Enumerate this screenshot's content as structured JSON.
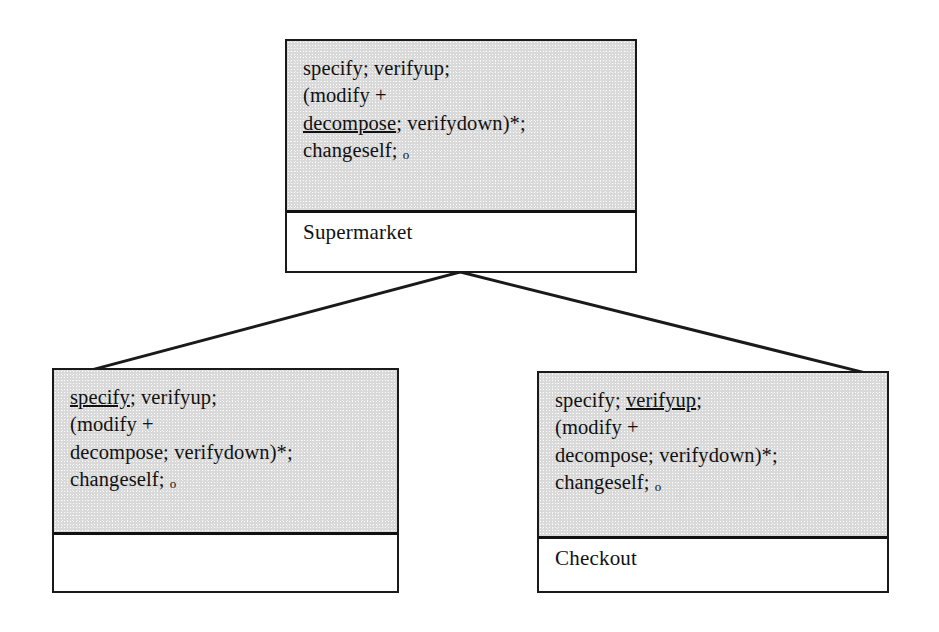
{
  "diagram": {
    "type": "class-hierarchy-tree",
    "background_color": "#ffffff",
    "node_body_color": "#d9d9d9",
    "line_color": "#1a1a1a"
  },
  "nodes": {
    "root": {
      "id": "root",
      "label": "Supermarket",
      "spec_lines": [
        {
          "segments": [
            {
              "text": "specify; verifyup;",
              "underline": false
            }
          ]
        },
        {
          "segments": [
            {
              "text": "(modify +",
              "underline": false
            }
          ]
        },
        {
          "segments": [
            {
              "text": "decompose",
              "underline": true
            },
            {
              "text": "; verifydown)*;",
              "underline": false
            }
          ]
        },
        {
          "segments": [
            {
              "text": "changeself; ",
              "underline": false
            },
            {
              "text": "o",
              "underline": false,
              "small": true
            }
          ]
        }
      ]
    },
    "left": {
      "id": "left",
      "label": "",
      "spec_lines": [
        {
          "segments": [
            {
              "text": "specify",
              "underline": true
            },
            {
              "text": "; verifyup;",
              "underline": false
            }
          ]
        },
        {
          "segments": [
            {
              "text": "(modify +",
              "underline": false
            }
          ]
        },
        {
          "segments": [
            {
              "text": "decompose; verifydown)*;",
              "underline": false
            }
          ]
        },
        {
          "segments": [
            {
              "text": "changeself; ",
              "underline": false
            },
            {
              "text": "o",
              "underline": false,
              "small": true
            }
          ]
        }
      ]
    },
    "right": {
      "id": "right",
      "label": "Checkout",
      "spec_lines": [
        {
          "segments": [
            {
              "text": "specify; ",
              "underline": false
            },
            {
              "text": "verifyup",
              "underline": true
            },
            {
              "text": ";",
              "underline": false
            }
          ]
        },
        {
          "segments": [
            {
              "text": "(modify +",
              "underline": false
            }
          ]
        },
        {
          "segments": [
            {
              "text": "decompose; verifydown)*;",
              "underline": false
            }
          ]
        },
        {
          "segments": [
            {
              "text": "changeself; ",
              "underline": false
            },
            {
              "text": "o",
              "underline": false,
              "small": true
            }
          ]
        }
      ]
    }
  },
  "connectors": [
    {
      "id": "root-to-left",
      "from": "root",
      "to": "left",
      "x1": 460,
      "y1": 272,
      "x2": 95,
      "y2": 369
    },
    {
      "id": "root-to-right",
      "from": "root",
      "to": "right",
      "x1": 460,
      "y1": 272,
      "x2": 862,
      "y2": 372
    }
  ]
}
